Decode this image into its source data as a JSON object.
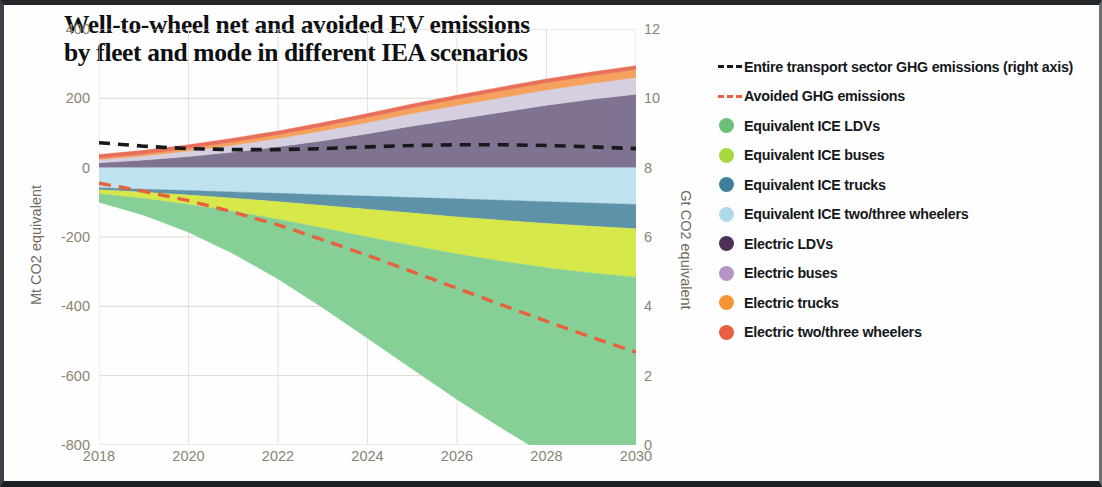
{
  "chart_data": {
    "type": "area",
    "title": "Well-to-wheel net and avoided EV  emissions\nby fleet and mode in different IEA scenarios",
    "xlabel": "",
    "ylabel": "Mt CO2 equivalent",
    "ylabel_right": "Gt CO2 equivalent",
    "x": [
      2018,
      2019,
      2020,
      2021,
      2022,
      2023,
      2024,
      2025,
      2026,
      2027,
      2028,
      2029,
      2030
    ],
    "xtick_labels": [
      "2018",
      "2020",
      "2022",
      "2024",
      "2026",
      "2028",
      "2030"
    ],
    "xtick_values": [
      2018,
      2020,
      2022,
      2024,
      2026,
      2028,
      2030
    ],
    "ytick_labels_left": [
      "400",
      "200",
      "0",
      "-200",
      "-400",
      "-600",
      "-800"
    ],
    "ytick_values_left": [
      400,
      200,
      0,
      -200,
      -400,
      -600,
      -800
    ],
    "ylim_left": [
      -800,
      400
    ],
    "ytick_labels_right": [
      "12",
      "10",
      "8",
      "6",
      "4",
      "2",
      "0"
    ],
    "ytick_values_right": [
      12,
      10,
      8,
      6,
      4,
      2,
      0
    ],
    "ylim_right": [
      0,
      12
    ],
    "grid": true,
    "legend_position": "right",
    "series": [
      {
        "name": "Electric LDVs",
        "type": "area",
        "stack": "positive",
        "color": "#7f7391",
        "values": [
          14,
          22,
          32,
          45,
          60,
          78,
          98,
          120,
          140,
          160,
          180,
          197,
          212
        ]
      },
      {
        "name": "Electric buses",
        "type": "area",
        "stack": "positive",
        "color": "#d6cfe0",
        "values": [
          9,
          12,
          16,
          20,
          24,
          28,
          32,
          36,
          39,
          42,
          44,
          46,
          48
        ]
      },
      {
        "name": "Electric trucks",
        "type": "area",
        "stack": "positive",
        "color": "#f4a25e",
        "values": [
          4,
          5,
          7,
          9,
          11,
          13,
          15,
          17,
          19,
          20,
          21,
          22,
          23
        ]
      },
      {
        "name": "Electric two/three wheelers",
        "type": "area",
        "stack": "positive",
        "color": "#e8705a",
        "values": [
          11,
          11,
          11,
          11,
          11,
          11,
          11,
          11,
          11,
          11,
          11,
          11,
          11
        ]
      },
      {
        "name": "Equivalent ICE two/three wheelers",
        "type": "area",
        "stack": "negative",
        "color": "#bfe3ee",
        "values": [
          -58,
          -62,
          -66,
          -70,
          -74,
          -78,
          -82,
          -86,
          -90,
          -94,
          -98,
          -102,
          -106
        ]
      },
      {
        "name": "Equivalent ICE trucks",
        "type": "area",
        "stack": "negative",
        "color": "#5e92a8",
        "values": [
          -6,
          -9,
          -13,
          -18,
          -24,
          -31,
          -38,
          -45,
          -52,
          -58,
          -63,
          -67,
          -70
        ]
      },
      {
        "name": "Equivalent ICE buses",
        "type": "area",
        "stack": "negative",
        "color": "#d6e84a",
        "values": [
          -11,
          -18,
          -27,
          -38,
          -51,
          -65,
          -80,
          -94,
          -107,
          -118,
          -128,
          -135,
          -140
        ]
      },
      {
        "name": "Equivalent ICE LDVs",
        "type": "area",
        "stack": "negative",
        "color": "#86cf96",
        "values": [
          -25,
          -48,
          -80,
          -122,
          -172,
          -230,
          -292,
          -356,
          -420,
          -482,
          -540,
          -592,
          -638
        ]
      }
    ],
    "lines": [
      {
        "name": "Entire transport sector GHG emissions (right axis)",
        "axis": "right",
        "style": "dashed",
        "color": "#17191b",
        "values": [
          8.72,
          8.62,
          8.55,
          8.52,
          8.52,
          8.55,
          8.6,
          8.64,
          8.66,
          8.66,
          8.64,
          8.6,
          8.55
        ]
      },
      {
        "name": "Avoided GHG emissions",
        "axis": "left",
        "style": "dashed",
        "color": "#e8613f",
        "values": [
          -45,
          -68,
          -95,
          -128,
          -165,
          -208,
          -253,
          -300,
          -348,
          -396,
          -443,
          -489,
          -532
        ]
      }
    ]
  },
  "legend": {
    "items": [
      {
        "label": "Entire transport sector GHG emissions (right axis)",
        "marker": "dashed-line",
        "color": "#17191b"
      },
      {
        "label": "Avoided GHG emissions",
        "marker": "dashed-line",
        "color": "#e8613f"
      },
      {
        "label": "Equivalent ICE LDVs",
        "marker": "dot",
        "color": "#6cc078"
      },
      {
        "label": "Equivalent ICE buses",
        "marker": "dot",
        "color": "#a5d93c"
      },
      {
        "label": "Equivalent ICE trucks",
        "marker": "dot",
        "color": "#3f8099"
      },
      {
        "label": "Equivalent ICE two/three wheelers",
        "marker": "dot",
        "color": "#add9e8"
      },
      {
        "label": "Electric LDVs",
        "marker": "dot",
        "color": "#4c3057"
      },
      {
        "label": "Electric buses",
        "marker": "dot",
        "color": "#b694c4"
      },
      {
        "label": "Electric trucks",
        "marker": "dot",
        "color": "#f59335"
      },
      {
        "label": "Electric two/three wheelers",
        "marker": "dot",
        "color": "#e8603f"
      }
    ]
  }
}
